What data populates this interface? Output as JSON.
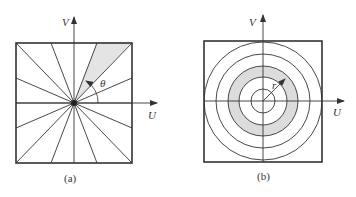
{
  "panels": [
    {
      "id": "a",
      "caption": "(a)",
      "description": "Radial wedge filter in frequency plane",
      "axis_u": "U",
      "axis_v": "V",
      "angle_label": "θ",
      "wedge_fill": "#e4e4e4",
      "line_color": "#333333"
    },
    {
      "id": "b",
      "caption": "(b)",
      "description": "Concentric ring filter in frequency plane",
      "axis_u": "U",
      "axis_v": "V",
      "radius_label": "r",
      "ring_fill": "#dcdcdc",
      "line_color": "#333333"
    }
  ]
}
